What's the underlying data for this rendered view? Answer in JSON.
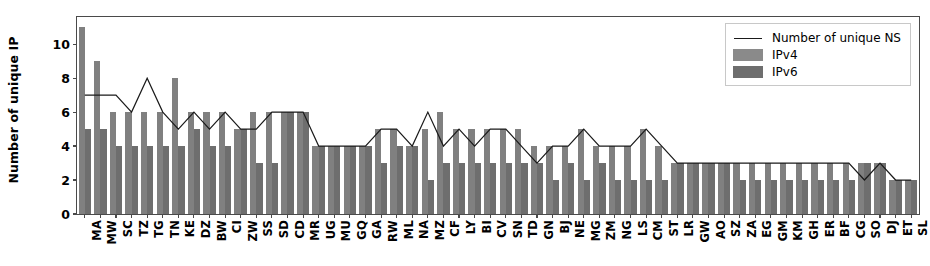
{
  "chart_data": {
    "type": "bar",
    "title": "",
    "xlabel": "",
    "ylabel": "Number of unique IP",
    "ylim": [
      0,
      11.6
    ],
    "yticks": [
      0,
      2,
      4,
      6,
      8,
      10
    ],
    "grid": false,
    "legend_position": "upper right",
    "categories": [
      "MA",
      "MW",
      "SC",
      "TZ",
      "TG",
      "TN",
      "KE",
      "DZ",
      "BW",
      "CI",
      "ZW",
      "SS",
      "SD",
      "CD",
      "MR",
      "UG",
      "MU",
      "GQ",
      "GA",
      "RW",
      "ML",
      "NA",
      "MZ",
      "CF",
      "LY",
      "BI",
      "CV",
      "SN",
      "TD",
      "GN",
      "BJ",
      "NE",
      "MG",
      "ZM",
      "NG",
      "LS",
      "CM",
      "ST",
      "LR",
      "GW",
      "AO",
      "SZ",
      "ZA",
      "EG",
      "GM",
      "KM",
      "GH",
      "ER",
      "BF",
      "CG",
      "SO",
      "DJ",
      "ET",
      "SL"
    ],
    "series": [
      {
        "name": "IPv4",
        "type": "bar",
        "color": "#808080",
        "values": [
          11,
          9,
          6,
          6,
          6,
          6,
          8,
          6,
          6,
          6,
          5,
          6,
          6,
          6,
          6,
          4,
          4,
          4,
          4,
          5,
          5,
          4,
          5,
          6,
          5,
          5,
          5,
          5,
          5,
          4,
          4,
          4,
          5,
          4,
          4,
          4,
          5,
          4,
          3,
          3,
          3,
          3,
          3,
          3,
          3,
          3,
          3,
          3,
          3,
          3,
          3,
          3,
          2,
          2
        ]
      },
      {
        "name": "IPv6",
        "type": "bar",
        "color": "#6e6e6e",
        "values": [
          5,
          5,
          4,
          4,
          4,
          4,
          4,
          5,
          4,
          4,
          5,
          3,
          3,
          6,
          6,
          4,
          4,
          4,
          4,
          3,
          4,
          4,
          2,
          3,
          3,
          3,
          3,
          3,
          3,
          3,
          2,
          3,
          2,
          3,
          2,
          2,
          2,
          2,
          3,
          3,
          3,
          3,
          2,
          2,
          2,
          2,
          2,
          2,
          2,
          2,
          3,
          3,
          2,
          2
        ]
      },
      {
        "name": "Number of unique NS",
        "type": "line",
        "color": "#1a1a1a",
        "values": [
          7,
          7,
          7,
          6,
          8,
          6,
          5,
          6,
          5,
          6,
          5,
          5,
          6,
          6,
          6,
          4,
          4,
          4,
          4,
          5,
          5,
          4,
          6,
          4,
          5,
          4,
          5,
          5,
          4,
          3,
          4,
          4,
          5,
          4,
          4,
          4,
          5,
          4,
          3,
          3,
          3,
          3,
          3,
          3,
          3,
          3,
          3,
          3,
          3,
          3,
          2,
          3,
          2,
          2
        ]
      }
    ]
  },
  "legend": {
    "items": [
      {
        "label": "Number of unique NS",
        "key": "line"
      },
      {
        "label": "IPv4",
        "key": "swatch-v4"
      },
      {
        "label": "IPv6",
        "key": "swatch-v6"
      }
    ]
  },
  "colors": {
    "ipv4": "#808080",
    "ipv6": "#6e6e6e",
    "line": "#1a1a1a",
    "axis": "#4a4a4a",
    "background": "#ffffff"
  }
}
